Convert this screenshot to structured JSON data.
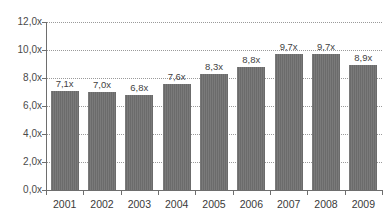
{
  "chart_data": {
    "type": "bar",
    "title": "",
    "subtitle": "",
    "xlabel": "",
    "ylabel": "",
    "categories": [
      "2001",
      "2002",
      "2003",
      "2004",
      "2005",
      "2006",
      "2007",
      "2008",
      "2009"
    ],
    "values": [
      7.1,
      7.0,
      6.8,
      7.6,
      8.3,
      8.8,
      9.7,
      9.7,
      8.9
    ],
    "value_labels": [
      "7,1x",
      "7,0x",
      "6,8x",
      "7,6x",
      "8,3x",
      "8,8x",
      "9,7x",
      "9,7x",
      "8,9x"
    ],
    "series": [
      {
        "name": "",
        "values": [
          7.1,
          7.0,
          6.8,
          7.6,
          8.3,
          8.8,
          9.7,
          9.7,
          8.9
        ]
      }
    ],
    "ylim": [
      0,
      12
    ],
    "ytick_values": [
      0,
      2,
      4,
      6,
      8,
      10,
      12
    ],
    "ytick_labels": [
      "0,0x",
      "2,0x",
      "4,0x",
      "6,0x",
      "8,0x",
      "10,0x",
      "12,0x"
    ],
    "grid": true,
    "grid_axis": "y",
    "grid_style": "dotted",
    "legend": false,
    "legend_position": "none",
    "annotations": [],
    "bar_color": "#6b6b6b",
    "grid_color": "#9a9a9a",
    "axis_color": "#6e6e6e",
    "label_color": "#3f3f3f",
    "background_color": "#ffffff"
  }
}
